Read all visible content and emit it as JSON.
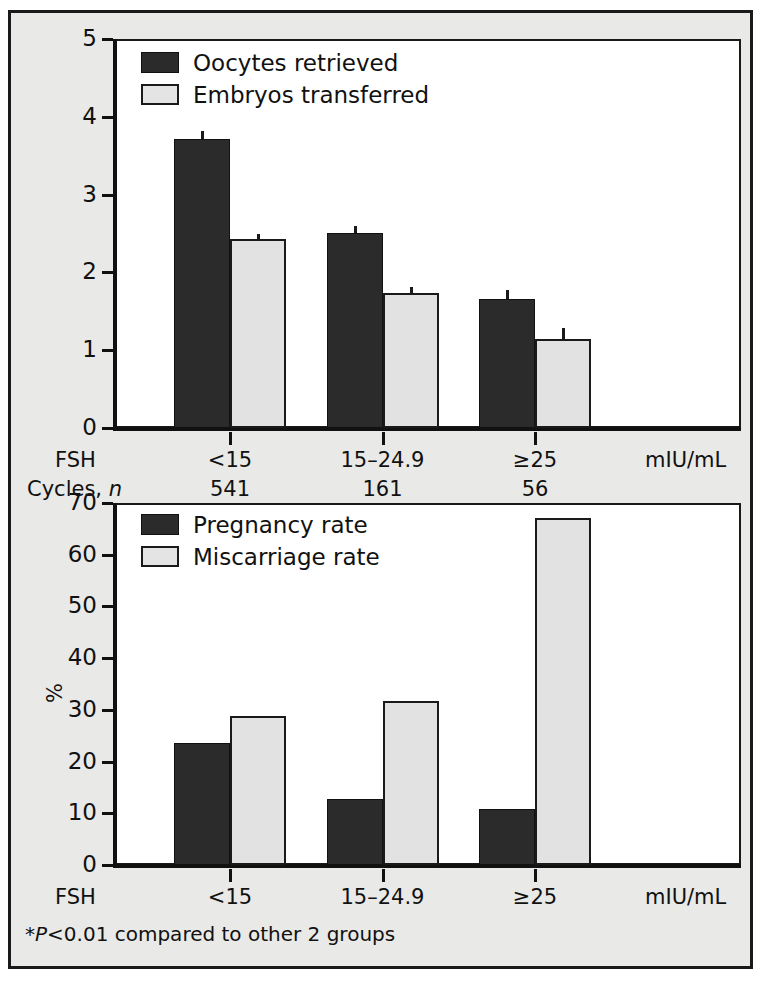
{
  "figure": {
    "background": "#e9e9e7",
    "border_color": "#1a1a1a",
    "series_colors": {
      "dark": "#2b2b2b",
      "light": "#e2e2e2"
    },
    "footnote": "P<0.01 compared to other 2 groups",
    "footnote_marker": "*"
  },
  "panel_top": {
    "legend": [
      {
        "label": "Oocytes retrieved",
        "swatch": "dark"
      },
      {
        "label": "Embryos transferred",
        "swatch": "light"
      }
    ],
    "yticks": [
      "0",
      "1",
      "2",
      "3",
      "4",
      "5"
    ],
    "xticklabels": [
      "<15",
      "15–24.9",
      "≥25"
    ],
    "axis_row_label": "FSH",
    "unit": "mIU/mL",
    "cycles_row_label_prefix": "Cycles, ",
    "cycles_row_label_italic": "n",
    "cycles_values": [
      "541",
      "161",
      "56"
    ]
  },
  "panel_bottom": {
    "legend": [
      {
        "label": "Pregnancy rate",
        "swatch": "dark"
      },
      {
        "label": "Miscarriage rate",
        "swatch": "light"
      }
    ],
    "yticks": [
      "0",
      "10",
      "20",
      "30",
      "40",
      "50",
      "60",
      "70"
    ],
    "ylabel": "%",
    "xticklabels": [
      "<15",
      "15–24.9",
      "≥25"
    ],
    "axis_row_label": "FSH",
    "unit": "mIU/mL"
  },
  "chart_data": [
    {
      "type": "bar",
      "title": "",
      "xlabel": "FSH (mIU/mL)",
      "ylabel": "",
      "ylim": [
        0,
        5
      ],
      "yticks": [
        0,
        1,
        2,
        3,
        4,
        5
      ],
      "grid": false,
      "legend_position": "top-left",
      "categories": [
        "<15",
        "15–24.9",
        "≥25"
      ],
      "group_sizes": [
        541,
        161,
        56
      ],
      "group_size_label": "Cycles, n",
      "series": [
        {
          "name": "Oocytes retrieved",
          "values": [
            3.72,
            2.51,
            1.66
          ],
          "errors": [
            0.1,
            0.08,
            0.12
          ],
          "color": "#2b2b2b"
        },
        {
          "name": "Embryos transferred",
          "values": [
            2.43,
            1.74,
            1.15
          ],
          "errors": [
            0.06,
            0.07,
            0.13
          ],
          "color": "#e2e2e2"
        }
      ]
    },
    {
      "type": "bar",
      "title": "",
      "xlabel": "FSH (mIU/mL)",
      "ylabel": "%",
      "ylim": [
        0,
        70
      ],
      "yticks": [
        0,
        10,
        20,
        30,
        40,
        50,
        60,
        70
      ],
      "grid": false,
      "legend_position": "top-left",
      "categories": [
        "<15",
        "15–24.9",
        "≥25"
      ],
      "series": [
        {
          "name": "Pregnancy rate",
          "values": [
            23.5,
            12.8,
            10.8
          ],
          "color": "#2b2b2b"
        },
        {
          "name": "Miscarriage rate",
          "values": [
            28.8,
            31.8,
            67.1
          ],
          "color": "#e2e2e2"
        }
      ]
    }
  ]
}
